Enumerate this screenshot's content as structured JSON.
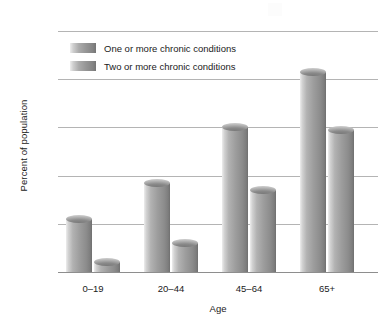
{
  "chart_data": {
    "type": "bar",
    "title": "",
    "subtitle": "",
    "xlabel": "Age",
    "ylabel": "Percent of population",
    "categories": [
      "0–19",
      "20–44",
      "45–64",
      "65+"
    ],
    "series": [
      {
        "name": "One or more chronic conditions",
        "values": [
          22,
          37,
          60,
          83
        ]
      },
      {
        "name": "Two or more chronic conditions",
        "values": [
          4,
          12,
          34,
          59
        ]
      }
    ],
    "ylim": [
      0,
      100
    ],
    "yticks": [
      0,
      20,
      40,
      60,
      80,
      100
    ],
    "ytick_labels": [
      "0",
      "20",
      "40",
      "60",
      "80",
      "100"
    ],
    "grid": true,
    "legend_position": "upper left",
    "colors": {
      "series1": "#9d9d9d",
      "series2": "#9d9d9d",
      "gridline": "#b4b4b4",
      "axis": "#8e8e8e",
      "text": "#1a1a1a",
      "background": "#ffffff"
    }
  },
  "legend": {
    "items": [
      {
        "label": "One or more chronic conditions"
      },
      {
        "label": "Two or more chronic conditions"
      }
    ]
  },
  "axes": {
    "y_title": "Percent of population",
    "x_title": "Age"
  }
}
